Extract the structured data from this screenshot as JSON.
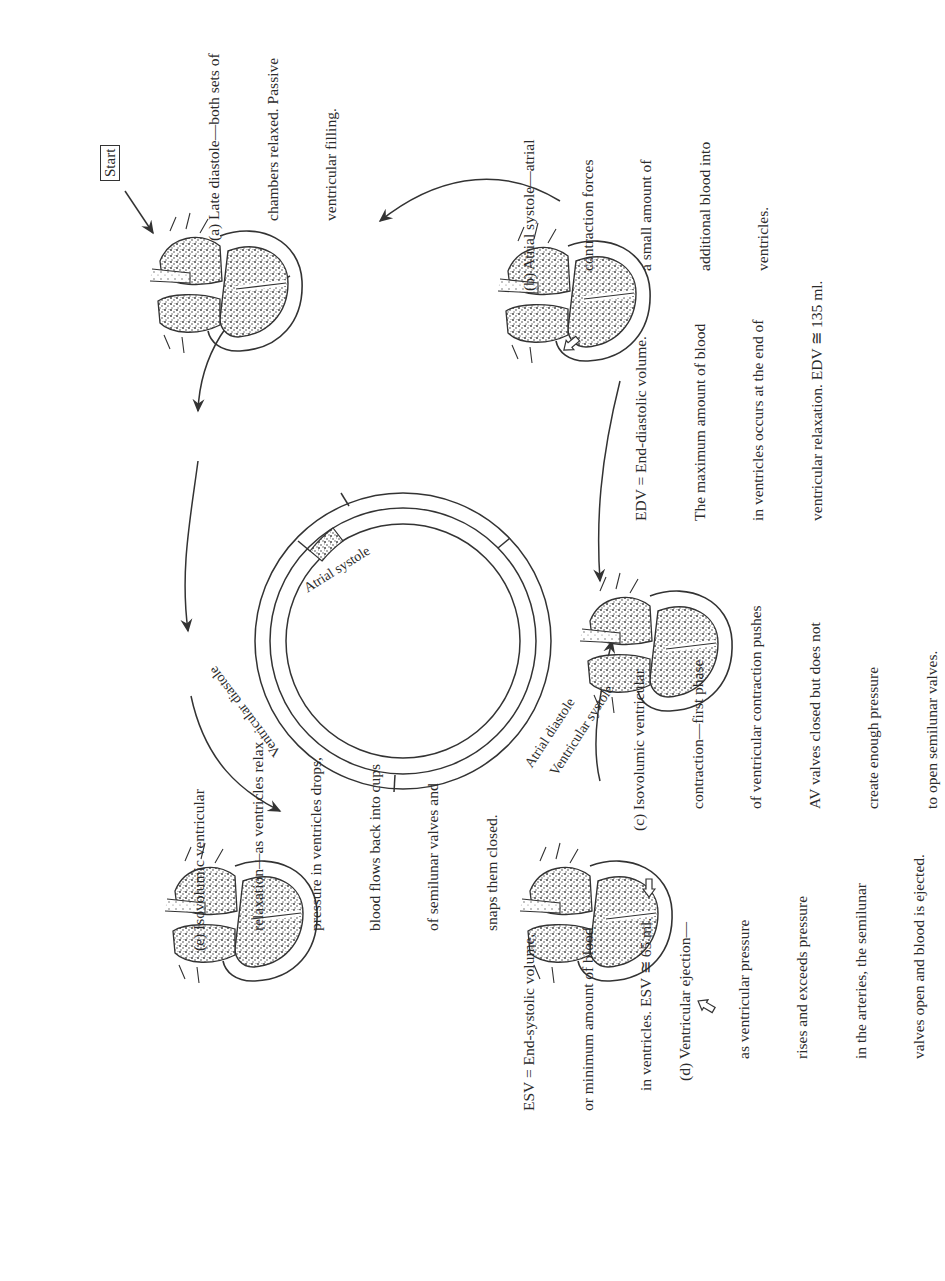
{
  "figure": {
    "start_label": "Start",
    "ring": {
      "outer_segments": [
        {
          "id": "atrial-systole",
          "label": "Atrial systole"
        },
        {
          "id": "atrial-diastole",
          "label": "Atrial diastole"
        }
      ],
      "inner_segments": [
        {
          "id": "ventricular-diastole",
          "label": "Ventricular diastole"
        },
        {
          "id": "ventricular-systole",
          "label": "Ventricular systole"
        }
      ]
    },
    "stages": [
      {
        "id": "a",
        "lines": [
          "(a) Late diastole—both sets of",
          "chambers relaxed. Passive",
          "ventricular filling."
        ]
      },
      {
        "id": "b",
        "lines": [
          "(b) Atrial systole—atrial",
          "contraction forces",
          "a small amount of",
          "additional blood into",
          "ventricles."
        ]
      },
      {
        "id": "c",
        "lines": [
          "(c) Isovolumic ventricular",
          "contraction—first phase",
          "of ventricular contraction pushes",
          "AV valves closed but does not",
          "create enough pressure",
          "to open semilunar valves."
        ]
      },
      {
        "id": "d",
        "lines": [
          "(d) Ventricular ejection—",
          "as ventricular pressure",
          "rises and exceeds pressure",
          "in the arteries, the semilunar",
          "valves open and blood is ejected."
        ]
      },
      {
        "id": "e",
        "lines": [
          "(e) Isovolumic ventricular",
          "relaxation—as ventricles relax",
          "pressure in ventricles drops,",
          "blood flows back into cups",
          "of semilunar valves and",
          "snaps them closed."
        ]
      }
    ],
    "notes": {
      "edv": [
        "EDV = End-diastolic volume.",
        "The maximum amount of blood",
        "in ventricles occurs at the end of",
        "ventricular relaxation. EDV ≅ 135 ml."
      ],
      "esv": [
        "ESV = End-systolic volume,",
        "or minimum amount of blood",
        "in ventricles. ESV ≅ 65 ml."
      ]
    }
  }
}
